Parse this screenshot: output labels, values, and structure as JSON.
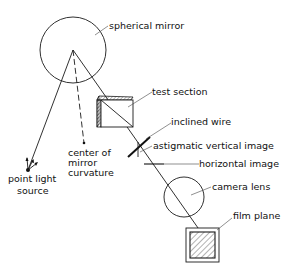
{
  "diagram": {
    "labels": {
      "spherical_mirror": "spherical mirror",
      "test_section": "test section",
      "inclined_wire": "inclined wire",
      "astigmatic_vertical_image": "astigmatic vertical image",
      "horizontal_image": "horizontal image",
      "camera_lens": "camera lens",
      "film_plane": "film plane",
      "point_light_source_line1": "point light",
      "point_light_source_line2": "source",
      "center_line1": "center of",
      "center_line2": "mirror",
      "center_line3": "curvature"
    },
    "colors": {
      "line": "#1a1a1a",
      "background": "#ffffff"
    }
  }
}
